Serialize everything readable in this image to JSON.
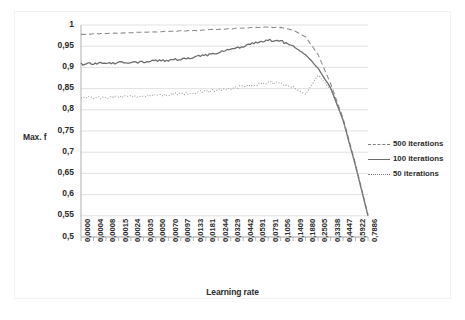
{
  "chart_data": {
    "type": "line",
    "title": "",
    "xlabel": "Learning rate",
    "ylabel": "Max. f",
    "ylim": [
      0.5,
      1.0
    ],
    "yticks": [
      "0,5",
      "0,55",
      "0,6",
      "0,65",
      "0,7",
      "0,75",
      "0,8",
      "0,85",
      "0,9",
      "0,95",
      "1"
    ],
    "ytick_values": [
      0.5,
      0.55,
      0.6,
      0.65,
      0.7,
      0.75,
      0.8,
      0.85,
      0.9,
      0.95,
      1.0
    ],
    "grid": true,
    "legend_position": "right",
    "categories": [
      "0,0000",
      "0,0004",
      "0,0008",
      "0,0015",
      "0,0024",
      "0,0035",
      "0,0050",
      "0,0070",
      "0,0097",
      "0,0133",
      "0,0181",
      "0,0244",
      "0,0329",
      "0,0442",
      "0,0591",
      "0,0791",
      "0,1056",
      "0,1409",
      "0,1880",
      "0,2505",
      "0,3338",
      "0,4447",
      "0,5922",
      "0,7886"
    ],
    "category_values": [
      0.0,
      0.0004,
      0.0008,
      0.0015,
      0.0024,
      0.0035,
      0.005,
      0.007,
      0.0097,
      0.0133,
      0.0181,
      0.0244,
      0.0329,
      0.0442,
      0.0591,
      0.0791,
      0.1056,
      0.1409,
      0.188,
      0.2505,
      0.3338,
      0.4447,
      0.5922,
      0.7886
    ],
    "series": [
      {
        "name": "500 iterations",
        "style": "dashed",
        "color": "#8a8a8a",
        "values": [
          0.978,
          0.979,
          0.98,
          0.981,
          0.982,
          0.983,
          0.984,
          0.985,
          0.986,
          0.987,
          0.988,
          0.99,
          0.991,
          0.993,
          0.994,
          0.995,
          0.994,
          0.988,
          0.972,
          0.93,
          0.862,
          0.78,
          0.672,
          0.552
        ]
      },
      {
        "name": "100 iterations",
        "style": "solid",
        "color": "#6b6b6b",
        "values": [
          0.908,
          0.909,
          0.91,
          0.911,
          0.912,
          0.913,
          0.915,
          0.917,
          0.92,
          0.924,
          0.929,
          0.935,
          0.942,
          0.95,
          0.958,
          0.964,
          0.962,
          0.95,
          0.93,
          0.898,
          0.852,
          0.776,
          0.668,
          0.55
        ]
      },
      {
        "name": "50 iterations",
        "style": "dotted",
        "color": "#9a9a9a",
        "values": [
          0.828,
          0.829,
          0.83,
          0.831,
          0.832,
          0.833,
          0.834,
          0.836,
          0.838,
          0.84,
          0.843,
          0.846,
          0.85,
          0.855,
          0.86,
          0.864,
          0.862,
          0.852,
          0.836,
          0.882,
          0.848,
          0.774,
          0.666,
          0.548
        ]
      }
    ]
  },
  "legend": {
    "items": [
      {
        "label": "500 iterations"
      },
      {
        "label": "100 iterations"
      },
      {
        "label": "50 iterations"
      }
    ]
  },
  "axes": {
    "x_title": "Learning rate",
    "y_title": "Max. f"
  },
  "colors": {
    "gridline": "#d9d9d9",
    "axis": "#a6a6a6",
    "text": "#2b2b2b",
    "series_500": "#8a8a8a",
    "series_100": "#6b6b6b",
    "series_50": "#9a9a9a"
  }
}
